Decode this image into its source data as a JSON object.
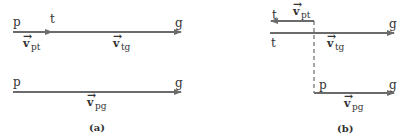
{
  "colors": {
    "line": "#6b6b6b",
    "text": "#333333",
    "background": "#ffffff"
  },
  "panel_a": {
    "caption": "(a)",
    "top_row": {
      "start_label": "p",
      "mid_label": "t",
      "end_label": "g",
      "vec_pt": {
        "symbol": "v",
        "subscript": "pt"
      },
      "vec_tg": {
        "symbol": "v",
        "subscript": "tg"
      }
    },
    "bottom_row": {
      "start_label": "p",
      "end_label": "g",
      "vec_pg": {
        "symbol": "v",
        "subscript": "pg"
      }
    }
  },
  "panel_b": {
    "caption": "(b)",
    "pt_arrow": {
      "end_label": "t",
      "vec_pt": {
        "symbol": "v",
        "subscript": "pt"
      }
    },
    "tg_arrow": {
      "start_label": "t",
      "end_label": "g",
      "vec_tg": {
        "symbol": "v",
        "subscript": "tg"
      }
    },
    "pg_arrow": {
      "start_label": "p",
      "end_label": "g",
      "vec_pg": {
        "symbol": "v",
        "subscript": "pg"
      }
    }
  }
}
